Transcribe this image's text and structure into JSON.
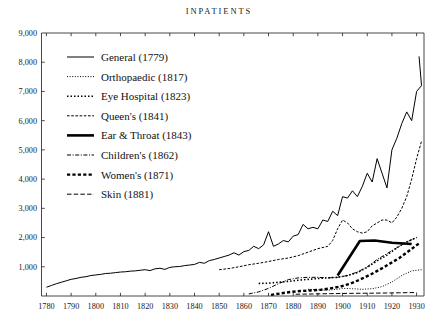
{
  "chart_data": {
    "type": "line",
    "title": "INPATIENTS",
    "xlabel": "",
    "ylabel": "",
    "xlim": [
      1778,
      1933
    ],
    "ylim": [
      0,
      9000
    ],
    "grid": false,
    "legend_position": "upper-left-inside",
    "y_ticks": [
      0,
      1000,
      2000,
      3000,
      4000,
      5000,
      6000,
      7000,
      8000,
      9000
    ],
    "y_tick_labels": [
      "",
      "1,000",
      "2,000",
      "3,000",
      "4,000",
      "5,000",
      "6,000",
      "7,000",
      "8,000",
      "9,000"
    ],
    "x_ticks": [
      1780,
      1790,
      1800,
      1810,
      1820,
      1830,
      1840,
      1850,
      1860,
      1870,
      1880,
      1890,
      1900,
      1910,
      1920,
      1930
    ],
    "x_tick_labels": [
      "1780",
      "1790",
      "1800",
      "1810",
      "1820",
      "1830",
      "1840",
      "1850",
      "1860",
      "1870",
      "1880",
      "1890",
      "1900",
      "1910",
      "1920",
      "1930"
    ],
    "series": [
      {
        "name": "General",
        "founded": "1779",
        "label": "General (1779)",
        "style": "solid",
        "stroke_width": 1.0,
        "dash": "",
        "x": [
          1780,
          1782,
          1784,
          1786,
          1788,
          1790,
          1792,
          1794,
          1796,
          1798,
          1800,
          1802,
          1804,
          1806,
          1808,
          1810,
          1812,
          1814,
          1816,
          1818,
          1820,
          1822,
          1824,
          1826,
          1828,
          1830,
          1832,
          1834,
          1836,
          1838,
          1840,
          1842,
          1844,
          1846,
          1848,
          1850,
          1852,
          1854,
          1856,
          1858,
          1860,
          1862,
          1864,
          1866,
          1868,
          1870,
          1872,
          1874,
          1876,
          1878,
          1880,
          1882,
          1884,
          1886,
          1888,
          1890,
          1892,
          1894,
          1896,
          1898,
          1900,
          1902,
          1904,
          1906,
          1908,
          1910,
          1912,
          1914,
          1916,
          1918,
          1920,
          1922,
          1924,
          1926,
          1928,
          1930,
          1932
        ],
        "y": [
          300,
          360,
          420,
          470,
          520,
          570,
          600,
          640,
          660,
          700,
          720,
          740,
          770,
          780,
          800,
          820,
          830,
          850,
          860,
          880,
          900,
          870,
          930,
          950,
          910,
          980,
          1000,
          1010,
          1040,
          1060,
          1080,
          1150,
          1120,
          1210,
          1250,
          1300,
          1350,
          1400,
          1480,
          1400,
          1520,
          1560,
          1700,
          1620,
          1750,
          2200,
          1700,
          1780,
          1900,
          1850,
          2050,
          2100,
          2450,
          2300,
          2350,
          2300,
          2600,
          2550,
          2900,
          2750,
          3400,
          3350,
          3600,
          3400,
          3750,
          4200,
          3900,
          4700,
          4200,
          3700,
          5000,
          5400,
          5900,
          6300,
          6000,
          7000,
          7200
        ],
        "endpoint_value": 8200
      },
      {
        "name": "Orthopaedic",
        "founded": "1817",
        "label": "Orthopaedic (1817)",
        "style": "fine-dotted",
        "stroke_width": 1.0,
        "dash": "1,1.6",
        "x": [
          1886,
          1890,
          1894,
          1898,
          1900,
          1904,
          1908,
          1912,
          1916,
          1920,
          1924,
          1928,
          1932
        ],
        "y": [
          230,
          210,
          200,
          230,
          260,
          250,
          230,
          250,
          320,
          480,
          700,
          860,
          900
        ]
      },
      {
        "name": "Eye Hospital",
        "founded": "1823",
        "label": "Eye Hospital (1823)",
        "style": "bold-dotted",
        "stroke_width": 1.6,
        "dash": "1.5,2.0",
        "x": [
          1866,
          1870,
          1874,
          1878,
          1882,
          1886,
          1890,
          1894,
          1898,
          1902,
          1906,
          1910,
          1914,
          1918,
          1922,
          1926,
          1930
        ],
        "y": [
          430,
          440,
          470,
          500,
          540,
          570,
          600,
          620,
          640,
          700,
          800,
          980,
          1200,
          1400,
          1650,
          1850,
          2000
        ]
      },
      {
        "name": "Queen's",
        "founded": "1841",
        "label": "Queen's (1841)",
        "style": "dashed-short",
        "stroke_width": 1.0,
        "dash": "2.6,1.6",
        "x": [
          1850,
          1854,
          1858,
          1862,
          1866,
          1870,
          1874,
          1878,
          1882,
          1886,
          1890,
          1894,
          1896,
          1898,
          1900,
          1902,
          1904,
          1906,
          1908,
          1910,
          1912,
          1914,
          1916,
          1918,
          1920,
          1922,
          1924,
          1926,
          1928,
          1930,
          1932
        ],
        "y": [
          900,
          940,
          1000,
          1070,
          1120,
          1180,
          1250,
          1300,
          1380,
          1500,
          1620,
          1700,
          1900,
          2300,
          2600,
          2500,
          2300,
          2200,
          2150,
          2200,
          2400,
          2500,
          2600,
          2600,
          2500,
          2700,
          3000,
          3400,
          4000,
          4700,
          5300
        ]
      },
      {
        "name": "Ear & Throat",
        "founded": "1843",
        "label": "Ear & Throat (1843)",
        "style": "thick-solid",
        "stroke_width": 2.6,
        "dash": "",
        "x": [
          1898,
          1907,
          1913,
          1920,
          1928
        ],
        "y": [
          700,
          1880,
          1900,
          1820,
          1780
        ]
      },
      {
        "name": "Children's",
        "founded": "1862",
        "label": "Children's (1862)",
        "style": "dash-dot",
        "stroke_width": 1.0,
        "dash": "4,1.6,1,1.6",
        "x": [
          1862,
          1866,
          1870,
          1874,
          1878,
          1882,
          1886,
          1890,
          1894,
          1898,
          1902,
          1906,
          1910,
          1914,
          1918,
          1922,
          1926,
          1930
        ],
        "y": [
          70,
          140,
          260,
          420,
          560,
          620,
          640,
          640,
          620,
          640,
          700,
          820,
          1000,
          1250,
          1450,
          1650,
          1850,
          2000
        ]
      },
      {
        "name": "Women's",
        "founded": "1871",
        "label": "Women's (1871)",
        "style": "thick-dashed",
        "stroke_width": 2.4,
        "dash": "3.2,2.2",
        "x": [
          1871,
          1875,
          1879,
          1883,
          1887,
          1891,
          1895,
          1899,
          1903,
          1907,
          1911,
          1915,
          1919,
          1923,
          1927,
          1931
        ],
        "y": [
          40,
          90,
          140,
          170,
          190,
          210,
          260,
          320,
          420,
          560,
          720,
          900,
          1100,
          1300,
          1550,
          1800
        ]
      },
      {
        "name": "Skin",
        "founded": "1881",
        "label": "Skin (1881)",
        "style": "long-dashed",
        "stroke_width": 1.0,
        "dash": "4.5,2.2",
        "x": [
          1881,
          1888,
          1895,
          1902,
          1909,
          1916,
          1923,
          1930
        ],
        "y": [
          60,
          70,
          80,
          90,
          95,
          100,
          110,
          120
        ]
      }
    ]
  },
  "legend": {
    "items": [
      {
        "label": "General (1779)"
      },
      {
        "label": "Orthopaedic (1817)"
      },
      {
        "label": "Eye Hospital (1823)"
      },
      {
        "label": "Queen's (1841)"
      },
      {
        "label": "Ear & Throat (1843)"
      },
      {
        "label": "Children's (1862)"
      },
      {
        "label": "Women's (1871)"
      },
      {
        "label": "Skin (1881)"
      }
    ]
  }
}
